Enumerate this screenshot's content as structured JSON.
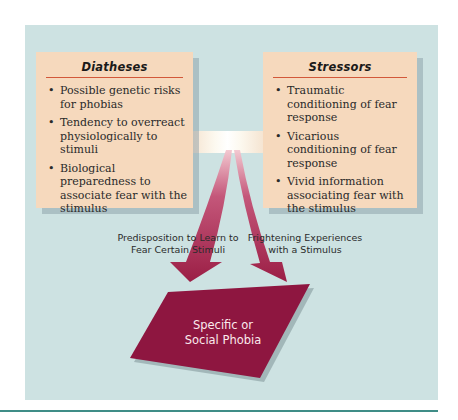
{
  "diagram": {
    "diatheses": {
      "title": "Diatheses",
      "items": [
        "Possible genetic risks for phobias",
        "Tendency to overreact physiologically to stimuli",
        "Biological preparedness to associate fear with the stimulus"
      ]
    },
    "stressors": {
      "title": "Stressors",
      "items": [
        "Traumatic conditioning of fear response",
        "Vicarious conditioning of fear response",
        "Vivid information associating fear with the stimulus"
      ]
    },
    "arrow_labels": {
      "left": "Predisposition to Learn to Fear Certain Stimuli",
      "right": "Frightening Experiences with a Stimulus"
    },
    "outcome": {
      "line1": "Specific or",
      "line2": "Social Phobia"
    },
    "colors": {
      "panel": "#cde2e2",
      "box": "#f6d9bd",
      "accent_rule": "#d2583a",
      "arrow": "#9b1e45",
      "outcome": "#8e1640",
      "bottom_rule": "#3f8d87"
    }
  }
}
